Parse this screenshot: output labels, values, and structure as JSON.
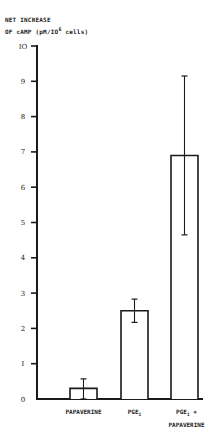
{
  "chart_data": {
    "type": "bar",
    "title": "",
    "ylabel": "NET INCREASE OF cAMP (pM/10^6 cells)",
    "ylabel_lines": [
      "NET INCREASE",
      "OF cAMP (pM/IO",
      "6",
      " cells)"
    ],
    "xlabel": "",
    "categories": [
      "PAPAVERINE",
      "PGE1",
      "PGE1 + PAPAVERINE"
    ],
    "category_labels": [
      {
        "main": "PAPAVERINE",
        "sub": "",
        "line2": ""
      },
      {
        "main": "PGE",
        "sub": "I",
        "line2": ""
      },
      {
        "main": "PGE",
        "sub": "I",
        "suffix": " +",
        "line2": "PAPAVERINE"
      }
    ],
    "values": [
      0.3,
      2.5,
      6.9
    ],
    "error_bars": [
      {
        "low": 0.0,
        "high": 0.57
      },
      {
        "low": 2.17,
        "high": 2.83
      },
      {
        "low": 4.65,
        "high": 9.15
      }
    ],
    "ylim": [
      0,
      10
    ],
    "yticks": [
      0,
      1,
      2,
      3,
      4,
      5,
      6,
      7,
      8,
      9,
      10
    ],
    "ytick_labels": [
      "0",
      "I",
      "2",
      "3",
      "4",
      "5",
      "6",
      "7",
      "8",
      "9",
      "IO"
    ],
    "grid": false,
    "legend": null,
    "bar_fill": "#ffffff",
    "line_color": "#1a1a1a"
  }
}
